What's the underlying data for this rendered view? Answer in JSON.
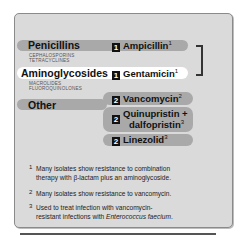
{
  "classes": [
    {
      "label": "Penicillins",
      "related": [
        "CEPHALOSPORINS",
        "TETRACYCLINES"
      ]
    },
    {
      "label": "Aminoglycosides",
      "related": [
        "MACROLIDES",
        "FLUOROQUINOLONES"
      ]
    },
    {
      "label": "Other"
    }
  ],
  "drugs": [
    {
      "rank": "1",
      "name": "Ampicillin",
      "note": "1"
    },
    {
      "rank": "1",
      "name": "Gentamicin",
      "note": "1"
    },
    {
      "rank": "2",
      "name": "Vancomycin",
      "note": "2"
    },
    {
      "rank": "2",
      "name_line1": "Quinupristin +",
      "name_line2": "dalfopristin",
      "note": "3"
    },
    {
      "rank": "2",
      "name": "Linezolid",
      "note": "3"
    }
  ],
  "footnotes": [
    {
      "mark": "1",
      "line1": "Many isolates show resistance to combination",
      "line2": "therapy with β-lactam plus an aminoglycoside."
    },
    {
      "mark": "2",
      "line1": "Many isolates show resistance to vancomycin."
    },
    {
      "mark": "3",
      "line1": "Used to treat infection with vancomycin-",
      "line2_pre": "resistant infections with ",
      "line2_em": "Enterococcus faecium",
      "line2_post": "."
    }
  ],
  "colors": {
    "panel": "#dadada",
    "bar_gray": "#a9a9a9",
    "bar_white": "#ffffff",
    "badge": "#111111"
  }
}
